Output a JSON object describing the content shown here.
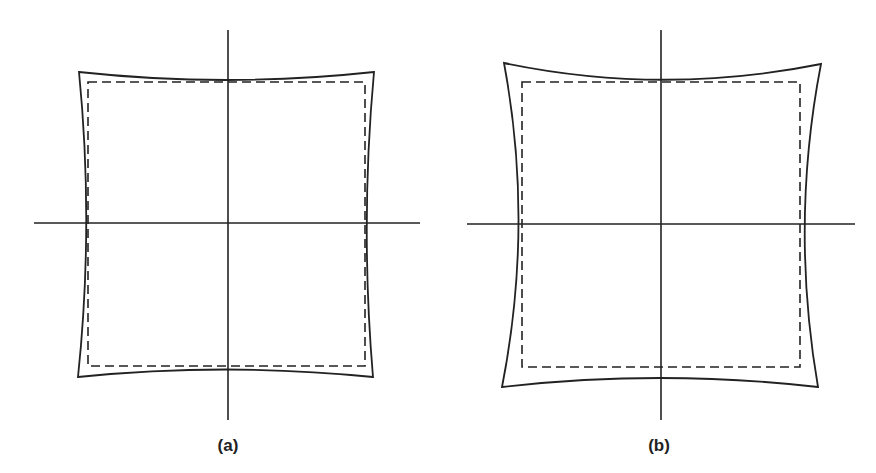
{
  "figure": {
    "colors": {
      "stroke": "#222222",
      "background": "#ffffff"
    },
    "panels": [
      {
        "id": "a",
        "caption": "(a)",
        "distortion": "mild pincushion",
        "axes": {
          "vertical_x": 228,
          "horizontal_y": 223
        },
        "solid_outline": "distorted",
        "dashed_outline": "ideal square"
      },
      {
        "id": "b",
        "caption": "(b)",
        "distortion": "strong pincushion",
        "axes": {
          "vertical_x": 661,
          "horizontal_y": 224
        },
        "solid_outline": "distorted",
        "dashed_outline": "ideal square"
      }
    ]
  }
}
